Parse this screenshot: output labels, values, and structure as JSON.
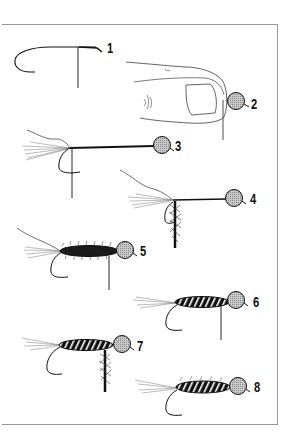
{
  "figure": {
    "steps": [
      {
        "label": "1",
        "x": 107,
        "y": 41
      },
      {
        "label": "2",
        "x": 251,
        "y": 97
      },
      {
        "label": "3",
        "x": 175,
        "y": 139
      },
      {
        "label": "4",
        "x": 250,
        "y": 192
      },
      {
        "label": "5",
        "x": 140,
        "y": 244
      },
      {
        "label": "6",
        "x": 253,
        "y": 295
      },
      {
        "label": "7",
        "x": 137,
        "y": 339
      },
      {
        "label": "8",
        "x": 254,
        "y": 380
      }
    ],
    "colors": {
      "ink": "#111111",
      "frame": "#9a9a9a",
      "bead": "#bdbdbd",
      "background": "#ffffff"
    }
  }
}
